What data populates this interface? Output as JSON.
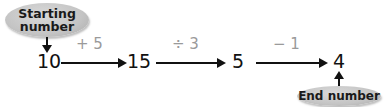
{
  "start_label": "Starting number",
  "start_label_line1": "Starting",
  "start_label_line2": "number",
  "end_label": "End number",
  "steps": [
    {
      "value": "10"
    },
    {
      "operation": "+ 5",
      "value": "15"
    },
    {
      "operation": "÷ 3",
      "value": "5"
    },
    {
      "operation": "− 1",
      "value": "4"
    }
  ],
  "colors": {
    "ellipse_fill": "#c4c4c4",
    "operation_text": "#9a9a9a",
    "number_text": "#111111"
  }
}
